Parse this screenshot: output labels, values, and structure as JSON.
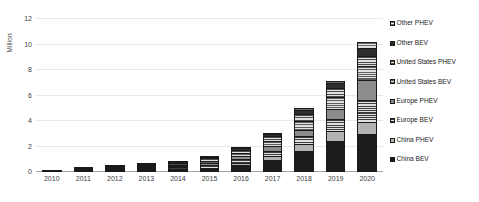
{
  "chart_data": {
    "type": "bar",
    "subtype": "stacked-bar",
    "title": "",
    "xlabel": "",
    "ylabel": "Million",
    "ylim": [
      0,
      12
    ],
    "ytick_values": [
      0,
      2,
      4,
      6,
      8,
      10,
      12
    ],
    "ytick_labels": [
      "0",
      "2",
      "4",
      "6",
      "8",
      "10",
      "12"
    ],
    "grid": true,
    "legend_position": "right",
    "legend_order": "reverse-stack",
    "categories": [
      "2010",
      "2011",
      "2012",
      "2013",
      "2014",
      "2015",
      "2016",
      "2017",
      "2018",
      "2019",
      "2020"
    ],
    "series": [
      {
        "name": "China BEV",
        "color": "#1c1c1c",
        "pattern": "solid",
        "values": [
          0.0,
          0.01,
          0.02,
          0.04,
          0.09,
          0.26,
          0.52,
          0.95,
          1.68,
          2.45,
          2.98
        ]
      },
      {
        "name": "China PHEV",
        "color": "#b3b3b3",
        "pattern": "solid",
        "values": [
          0.0,
          0.0,
          0.0,
          0.01,
          0.03,
          0.09,
          0.18,
          0.3,
          0.53,
          0.78,
          0.95
        ]
      },
      {
        "name": "Europe BEV",
        "color": "#3d3d3d",
        "pattern": "horizontal-lines",
        "values": [
          0.01,
          0.02,
          0.04,
          0.07,
          0.12,
          0.2,
          0.3,
          0.43,
          0.6,
          0.94,
          1.72
        ]
      },
      {
        "name": "Europe PHEV",
        "color": "#8c8c8c",
        "pattern": "solid",
        "values": [
          0.0,
          0.0,
          0.01,
          0.03,
          0.07,
          0.14,
          0.23,
          0.34,
          0.49,
          0.75,
          1.56
        ]
      },
      {
        "name": "United States BEV",
        "color": "#5e5e5e",
        "pattern": "horizontal-lines",
        "values": [
          0.0,
          0.01,
          0.03,
          0.07,
          0.13,
          0.21,
          0.3,
          0.45,
          0.73,
          0.98,
          1.13
        ]
      },
      {
        "name": "United States PHEV",
        "color": "#4a4a4a",
        "pattern": "horizontal-lines",
        "values": [
          0.0,
          0.01,
          0.03,
          0.06,
          0.11,
          0.17,
          0.24,
          0.36,
          0.55,
          0.68,
          0.74
        ]
      },
      {
        "name": "Other BEV",
        "color": "#2e2e2e",
        "pattern": "solid",
        "values": [
          0.0,
          0.0,
          0.01,
          0.02,
          0.03,
          0.05,
          0.09,
          0.17,
          0.27,
          0.38,
          0.62
        ]
      },
      {
        "name": "Other PHEV",
        "color": "#707070",
        "pattern": "horizontal-lines",
        "values": [
          0.0,
          0.0,
          0.0,
          0.01,
          0.02,
          0.03,
          0.05,
          0.09,
          0.15,
          0.22,
          0.49
        ]
      }
    ],
    "totals": [
      0.01,
      0.05,
      0.14,
      0.31,
      0.6,
      1.15,
      1.91,
      3.09,
      5.0,
      7.18,
      10.19
    ]
  }
}
